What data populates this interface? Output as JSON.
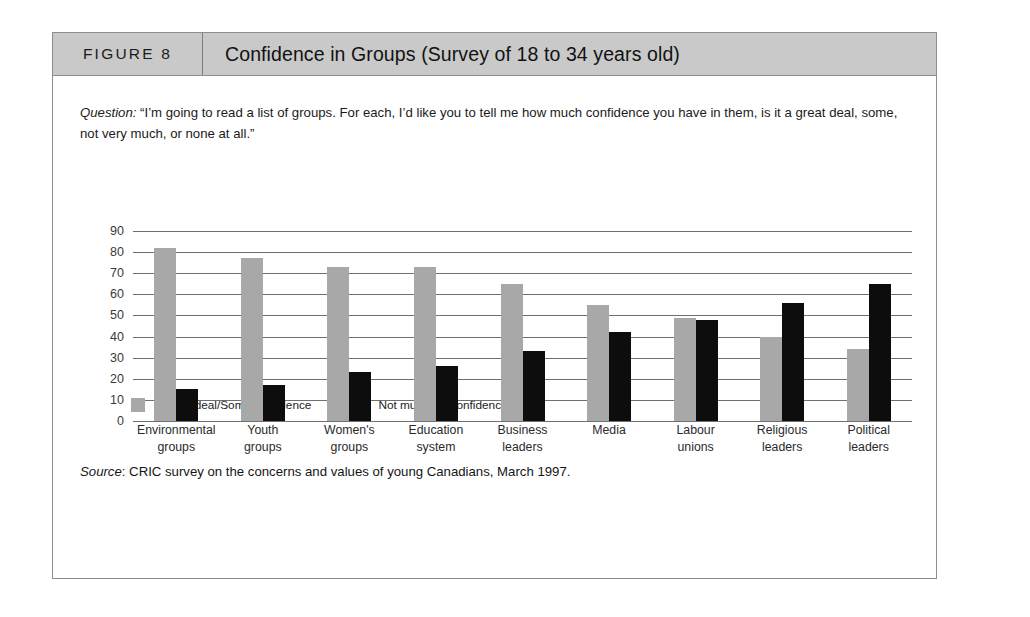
{
  "figure": {
    "number_label": "FIGURE 8",
    "title": "Confidence in Groups (Survey of 18 to 34 years old)",
    "question_prefix": "Question:",
    "question_text": " “I’m going to read a list of groups. For each, I’d like you to tell me how much confidence you have in them, is it a great deal, some, not very much, or none at all.”",
    "source_prefix": "Source",
    "source_text": ": CRIC survey on the concerns and values of young Canadians, March 1997."
  },
  "colors": {
    "series_gray": "#a8a8a8",
    "series_black": "#0d0d0d",
    "header_band": "#c9c9c9",
    "frame": "#8d8d8d",
    "gridline": "#6f6f6f"
  },
  "chart_data": {
    "type": "bar",
    "title": "Confidence in Groups (Survey of 18 to 34 years old)",
    "xlabel": "",
    "ylabel": "",
    "ylim": [
      0,
      90
    ],
    "yticks": [
      90,
      80,
      70,
      60,
      50,
      40,
      30,
      20,
      10,
      0
    ],
    "grid": true,
    "legend_position": "below-axis-left",
    "categories": [
      "Environmental\ngroups",
      "Youth\ngroups",
      "Women's\ngroups",
      "Education\nsystem",
      "Business\nleaders",
      "Media",
      "Labour\nunions",
      "Religious\nleaders",
      "Political\nleaders"
    ],
    "series": [
      {
        "name": "A great deal/Some confidence",
        "color": "#a8a8a8",
        "values": [
          82,
          77,
          73,
          73,
          65,
          55,
          49,
          40,
          34
        ]
      },
      {
        "name": "Not much/No confidence",
        "color": "#0d0d0d",
        "values": [
          15,
          17,
          23,
          26,
          33,
          42,
          48,
          56,
          65
        ]
      }
    ]
  }
}
